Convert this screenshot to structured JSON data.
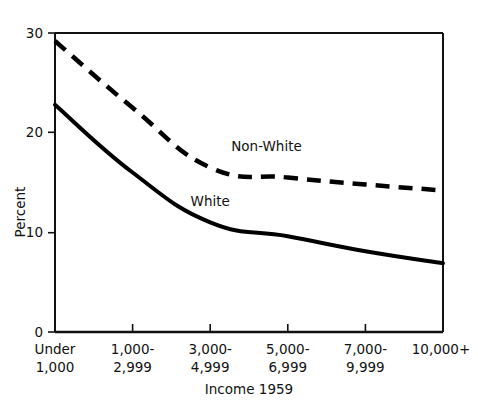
{
  "chart_data": {
    "type": "line",
    "title": "",
    "xlabel": "Income 1959",
    "ylabel": "Percent",
    "categories": [
      "Under 1,000",
      "1,000-2,999",
      "3,000-4,999",
      "5,000-6,999",
      "7,000-9,999",
      "10,000+"
    ],
    "category_lines": [
      [
        "Under",
        "1,000"
      ],
      [
        "1,000-",
        "2,999"
      ],
      [
        "3,000-",
        "4,999"
      ],
      [
        "5,000-",
        "6,999"
      ],
      [
        "7,000-",
        "9,999"
      ],
      [
        "10,000+",
        ""
      ]
    ],
    "ylim": [
      0,
      30
    ],
    "yticks": [
      0,
      10,
      20,
      30
    ],
    "ytick_labels": [
      "0",
      "10",
      "20",
      "30"
    ],
    "grid": false,
    "legend_position": "inline-annotation",
    "series": [
      {
        "name": "Non-White",
        "style": "dashed",
        "color": "#000000",
        "values": [
          29.2,
          22.5,
          16.5,
          15.5,
          14.8,
          14.2
        ],
        "label_x_frac": 0.545,
        "label_y_value": 18.2
      },
      {
        "name": "White",
        "style": "solid",
        "color": "#000000",
        "values": [
          22.8,
          16.0,
          11.0,
          9.6,
          8.1,
          6.9
        ],
        "label_x_frac": 0.4,
        "label_y_value": 12.6
      }
    ]
  }
}
